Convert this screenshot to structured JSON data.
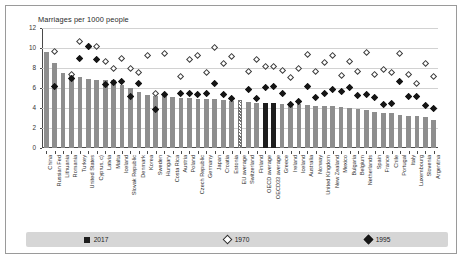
{
  "chart_data": {
    "type": "bar",
    "title": "Marriages per 1000 people",
    "xlabel": "",
    "ylabel": "",
    "ylim": [
      0,
      12
    ],
    "yticks": [
      0,
      2,
      4,
      6,
      8,
      10,
      12
    ],
    "grid": true,
    "legend_position": "bottom",
    "categories": [
      "China",
      "Russian Fed",
      "Lithuania",
      "Romania",
      "Turkey",
      "United States",
      "Cyprus, c)",
      "Latvia",
      "Malta",
      "Iceland",
      "Slovak Republic",
      "Denmark",
      "Korea",
      "Sweden",
      "Hungary",
      "Costa Rica",
      "Austria",
      "Poland",
      "Czech Republic",
      "Germany",
      "Japan",
      "Croatia",
      "Estonia",
      "EU average",
      "Switzerland",
      "Finland",
      "OECD average",
      "OECD33 average",
      "Greece",
      "Ireland",
      "Iceland",
      "Australia",
      "Norway",
      "United Kingdom",
      "New Zealand",
      "Mexico",
      "Bulgaria",
      "Belgium",
      "Netherlands",
      "Spain",
      "France",
      "Chile",
      "Portugal",
      "Italy",
      "Luxembourg",
      "Slovenia",
      "Argentina"
    ],
    "series": [
      {
        "name": "2017",
        "marker": "bar",
        "values": [
          9.6,
          8.5,
          7.5,
          7.3,
          7.1,
          6.9,
          6.8,
          6.8,
          6.8,
          6.3,
          6.0,
          5.6,
          5.3,
          5.2,
          5.2,
          5.1,
          5.0,
          5.0,
          4.9,
          4.9,
          4.9,
          4.8,
          4.7,
          4.6,
          4.6,
          4.5,
          4.5,
          4.5,
          4.4,
          4.4,
          4.4,
          4.3,
          4.2,
          4.2,
          4.2,
          4.1,
          4.0,
          3.9,
          3.8,
          3.6,
          3.5,
          3.5,
          3.3,
          3.2,
          3.2,
          3.1,
          2.8
        ]
      },
      {
        "name": "1970",
        "marker": "open-diamond",
        "values": [
          null,
          9.6,
          null,
          7.3,
          10.6,
          10.1,
          10.1,
          8.6,
          7.9,
          8.9,
          7.9,
          7.5,
          9.2,
          5.4,
          9.4,
          null,
          7.1,
          8.8,
          9.2,
          7.5,
          10.0,
          8.4,
          9.1,
          null,
          7.6,
          8.8,
          8.1,
          8.1,
          7.7,
          7.0,
          7.9,
          9.3,
          7.6,
          8.5,
          9.2,
          7.2,
          8.6,
          7.6,
          9.5,
          7.3,
          7.8,
          7.5,
          9.4,
          7.3,
          6.4,
          8.4,
          7.1
        ]
      },
      {
        "name": "1995",
        "marker": "filled-diamond",
        "values": [
          null,
          6.1,
          null,
          6.9,
          8.9,
          10.1,
          8.8,
          6.3,
          6.5,
          6.6,
          5.1,
          6.4,
          null,
          3.8,
          5.3,
          null,
          5.4,
          5.4,
          5.3,
          5.4,
          6.4,
          5.3,
          4.9,
          null,
          5.8,
          4.9,
          6.0,
          6.1,
          5.4,
          4.3,
          4.6,
          6.1,
          5.0,
          5.4,
          5.8,
          5.6,
          6.0,
          5.2,
          5.3,
          5.0,
          4.3,
          4.4,
          6.6,
          5.1,
          5.1,
          4.2,
          3.9
        ]
      }
    ],
    "hatched_categories": [
      "EU average"
    ],
    "dark_categories": [
      "OECD average",
      "OECD33 average"
    ],
    "legend": [
      {
        "label": "2017",
        "marker": "bar"
      },
      {
        "label": "1970",
        "marker": "open-diamond"
      },
      {
        "label": "1995",
        "marker": "filled-diamond"
      }
    ]
  }
}
